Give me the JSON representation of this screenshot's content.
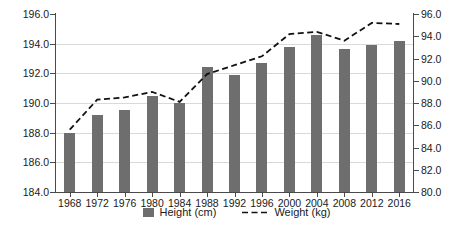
{
  "chart_data": {
    "type": "bar",
    "title": "",
    "subtitle": "",
    "xlabel": "",
    "ylabel": "",
    "grid": true,
    "legend_position": "bottom",
    "categories": [
      "1968",
      "1972",
      "1976",
      "1980",
      "1984",
      "1988",
      "1992",
      "1996",
      "2000",
      "2004",
      "2008",
      "2012",
      "2016"
    ],
    "series": [
      {
        "name": "Height (cm)",
        "type": "bar",
        "axis": "left",
        "color": "#6e6e6e",
        "values": [
          188.0,
          189.2,
          189.5,
          190.5,
          190.0,
          192.4,
          191.9,
          192.7,
          193.8,
          194.6,
          193.65,
          193.9,
          194.2
        ]
      },
      {
        "name": "Weight (kg)",
        "type": "line",
        "axis": "right",
        "color": "#111111",
        "style": "dashed",
        "values": [
          85.6,
          88.3,
          88.5,
          89.0,
          88.1,
          90.6,
          91.4,
          92.2,
          94.2,
          94.4,
          93.6,
          95.2,
          95.1
        ]
      }
    ],
    "axes": {
      "left": {
        "label": "",
        "min": 184.0,
        "max": 196.0,
        "step": 2.0,
        "ticks": [
          "184.0",
          "186.0",
          "188.0",
          "190.0",
          "192.0",
          "194.0",
          "196.0"
        ]
      },
      "right": {
        "label": "",
        "min": 80.0,
        "max": 96.0,
        "step": 2.0,
        "ticks": [
          "80.0",
          "82.0",
          "84.0",
          "86.0",
          "88.0",
          "90.0",
          "92.0",
          "94.0",
          "96.0"
        ]
      },
      "x": {
        "ticks": [
          "1968",
          "1972",
          "1976",
          "1980",
          "1984",
          "1988",
          "1992",
          "1996",
          "2000",
          "2004",
          "2008",
          "2012",
          "2016"
        ]
      }
    },
    "legend": [
      {
        "label": "Height (cm)",
        "marker": "square",
        "color": "#6e6e6e"
      },
      {
        "label": "Weight (kg)",
        "marker": "dashed-line",
        "color": "#111111"
      }
    ]
  }
}
